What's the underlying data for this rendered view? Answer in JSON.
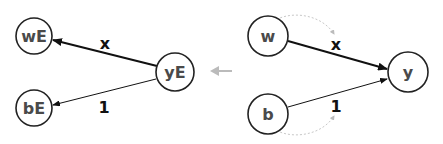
{
  "diagram": {
    "left_graph": {
      "nodes": [
        {
          "id": "wE",
          "label": "wE",
          "cx": 34,
          "cy": 36,
          "r": 18
        },
        {
          "id": "bE",
          "label": "bE",
          "cx": 34,
          "cy": 108,
          "r": 18
        },
        {
          "id": "yE",
          "label": "yE",
          "cx": 175,
          "cy": 72,
          "r": 19
        }
      ],
      "edges": [
        {
          "from": "yE",
          "to": "wE",
          "label": "x",
          "weight": "thick"
        },
        {
          "from": "yE",
          "to": "bE",
          "label": "1",
          "weight": "thin"
        }
      ]
    },
    "transition_arrow": {
      "direction": "left",
      "color": "#bbbbbb"
    },
    "right_graph": {
      "nodes": [
        {
          "id": "w",
          "label": "w",
          "cx": 268,
          "cy": 36,
          "r": 20
        },
        {
          "id": "b",
          "label": "b",
          "cx": 268,
          "cy": 114,
          "r": 20
        },
        {
          "id": "y",
          "label": "y",
          "cx": 408,
          "cy": 72,
          "r": 20
        }
      ],
      "edges": [
        {
          "from": "w",
          "to": "y",
          "label": "x",
          "weight": "thick"
        },
        {
          "from": "b",
          "to": "y",
          "label": "1",
          "weight": "thin"
        }
      ],
      "dotted_arcs": [
        {
          "from": "w",
          "to": "x-label",
          "style": "dashed-gray"
        },
        {
          "from": "b",
          "to": "1-label",
          "style": "dashed-gray"
        }
      ]
    },
    "colors": {
      "node_stroke": "#222222",
      "node_text": "#4a4a4a",
      "edge": "#111111",
      "arc": "#c8c8c8",
      "transition_arrow": "#bbbbbb"
    }
  },
  "labels": {
    "wE": "wE",
    "bE": "bE",
    "yE": "yE",
    "w": "w",
    "b": "b",
    "y": "y",
    "edge_x_left": "x",
    "edge_1_left": "1",
    "edge_x_right": "x",
    "edge_1_right": "1"
  }
}
